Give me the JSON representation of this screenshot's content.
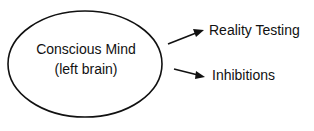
{
  "diagram": {
    "node": {
      "line1": "Conscious Mind",
      "line2": "(left brain)"
    },
    "outputs": [
      {
        "label": "Reality Testing"
      },
      {
        "label": "Inhibitions"
      }
    ]
  }
}
